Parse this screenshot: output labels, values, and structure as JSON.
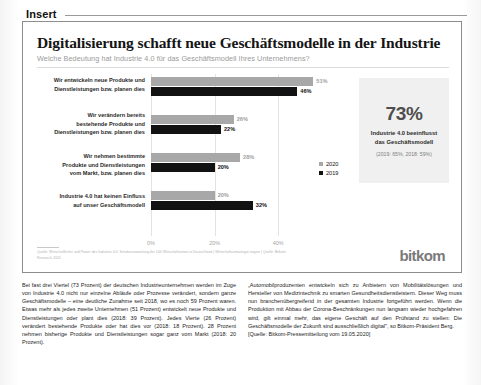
{
  "insert": {
    "label": "Insert"
  },
  "chart": {
    "title": "Digitalisierung schafft neue Geschäftsmodelle in der Industrie",
    "subtitle": "Welche Bedeutung hat Industrie 4.0 für das Geschäftsmodell Ihres Unternehmens?",
    "source": "Quelle: Wirtschaftlicher und Power des Industrie 4.0: Sonderauswertung der 100 Wirtschaftsnews in Deutschland | Wirtschaftsumsatzgut angest | Quelle: Bitkom Research 2020"
  },
  "chart_data": {
    "type": "bar",
    "orientation": "horizontal",
    "title": "Digitalisierung schafft neue Geschäftsmodelle in der Industrie",
    "subtitle": "Welche Bedeutung hat Industrie 4.0 für das Geschäftsmodell Ihres Unternehmens?",
    "categories": [
      "Wir entwickeln neue Produkte und\nDienstleistungen bzw. planen dies",
      "Wir verändern bereits\nbestehende Produkte und\nDienstleistungen bzw. planen dies",
      "Wir nehmen bestimmte\nProdukte und Dienstleistungen\nvom Markt, bzw. planen dies",
      "Industrie 4.0 hat keinen Einfluss\nauf unser Geschäftsmodell"
    ],
    "series": [
      {
        "name": "2020",
        "color": "#a8a8a8",
        "values": [
          51,
          26,
          28,
          20
        ],
        "labels": [
          "51%",
          "26%",
          "28%",
          "20%"
        ]
      },
      {
        "name": "2019",
        "color": "#121212",
        "values": [
          46,
          22,
          20,
          32
        ],
        "labels": [
          "46%",
          "22%",
          "20%",
          "32%"
        ]
      }
    ],
    "xlabel": "",
    "ylabel": "",
    "xlim": [
      0,
      55
    ],
    "xticks": [
      0,
      20,
      40
    ],
    "xticklabels": [
      "0%",
      "20%",
      "40%"
    ],
    "grid": true,
    "legend_position": "right-bottom"
  },
  "callout": {
    "percent": "73%",
    "line1": "Industrie 4.0 beeinflusst",
    "line2": "das Geschäftsmodell",
    "note": "(2019: 65%, 2018: 59%)"
  },
  "logo": {
    "text": "bitkom"
  },
  "body_text": {
    "left": "Bei fast drei Viertel (73 Prozent) der deutschen Industrieunternehmen werden im Zuge von Industrie 4.0 nicht nur einzelne Abläufe oder Prozesse verändert, sondern ganze Geschäftsmodelle – eine deutliche Zunahme seit 2018, wo es noch 59 Prozent waren. Etwas mehr als jedes zweite Unternehmen (51 Prozent) entwickelt neue Produkte und Dienstleistungen oder plant dies (2018: 39 Prozent). Jedes Vierte (26 Prozent) verändert bestehende Produkte oder hat dies vor (2018: 18 Prozent). 28 Prozent nehmen bisherige Produkte und Dienstleistungen sogar ganz vom Markt (2018: 20 Prozent).",
    "right": "„Automobilproduzenten entwickeln sich zu Anbietern von Mobilitätslösungen und Hersteller von Medizintechnik zu smarten Gesundheitsdienstleistern. Dieser Weg muss nun branchenübergreifend in der gesamten Industrie fortgeführt werden. Wenn die Produktion mit Abbau der Corona-Beschränkungen nun langsam wieder hochgefahren wird, gilt einmal mehr, das eigene Geschäft auf den Prüfstand zu stellen: Die Geschäftsmodelle der Zukunft sind ausschließlich digital\", so Bitkom-Präsident Berg.",
    "citation": "[Quelle: Bitkom-Pressemitteilung vom 19.05.2020]"
  }
}
